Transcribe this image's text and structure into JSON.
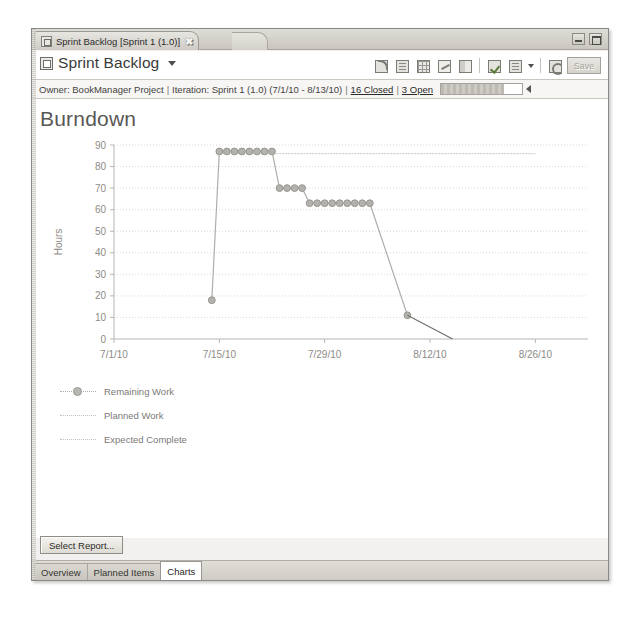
{
  "window": {
    "editor_tab_label": "Sprint Backlog [Sprint 1 (1.0)]",
    "close_glyph": "✖",
    "minimize_name": "minimize-button",
    "maximize_name": "maximize-button"
  },
  "form_header": {
    "title": "Sprint Backlog",
    "dropdown_caret": "▾",
    "save_label": "Save",
    "toolbar_icons": [
      "rss-feed-icon",
      "document-icon",
      "table-grid-icon",
      "link-icon",
      "collapse-panel-icon",
      "edit-checklist-icon",
      "new-document-icon",
      "refresh-icon"
    ]
  },
  "info_strip": {
    "owner_label": "Owner:",
    "owner_value": "BookManager Project",
    "iteration_label": "Iteration:",
    "iteration_value": "Sprint 1 (1.0) (7/1/10 - 8/13/10)",
    "closed_link": "16 Closed",
    "open_link": "3 Open",
    "separator": "|",
    "progress_percent": 78
  },
  "chart_data": {
    "type": "line",
    "title": "Burndown",
    "xlabel": "",
    "ylabel": "Hours",
    "ylim": [
      0,
      90
    ],
    "ytick_step": 10,
    "yticks": [
      0,
      10,
      20,
      30,
      40,
      50,
      60,
      70,
      80,
      90
    ],
    "xticks": [
      "7/1/10",
      "7/15/10",
      "7/29/10",
      "8/12/10",
      "8/26/10"
    ],
    "x_range_days": [
      0,
      63
    ],
    "xtick_days": [
      0,
      14,
      28,
      42,
      56
    ],
    "grid": true,
    "legend_position": "below-left",
    "colors": {
      "remaining_work": "#b0aeaa",
      "planned_work": "#c8c6c2",
      "expected_complete": "#6f6e6b",
      "grid": "#dcdad6",
      "axis": "#b8b6b2",
      "marker_fill": "#b4b2ae",
      "marker_stroke": "#98968f"
    },
    "series": [
      {
        "name": "Remaining Work",
        "marker": true,
        "points": [
          {
            "day": 13,
            "hours": 18
          },
          {
            "day": 14,
            "hours": 87
          },
          {
            "day": 15,
            "hours": 87
          },
          {
            "day": 16,
            "hours": 87
          },
          {
            "day": 17,
            "hours": 87
          },
          {
            "day": 18,
            "hours": 87
          },
          {
            "day": 19,
            "hours": 87
          },
          {
            "day": 20,
            "hours": 87
          },
          {
            "day": 21,
            "hours": 87
          },
          {
            "day": 22,
            "hours": 70
          },
          {
            "day": 23,
            "hours": 70
          },
          {
            "day": 24,
            "hours": 70
          },
          {
            "day": 25,
            "hours": 70
          },
          {
            "day": 26,
            "hours": 63
          },
          {
            "day": 27,
            "hours": 63
          },
          {
            "day": 28,
            "hours": 63
          },
          {
            "day": 29,
            "hours": 63
          },
          {
            "day": 30,
            "hours": 63
          },
          {
            "day": 31,
            "hours": 63
          },
          {
            "day": 32,
            "hours": 63
          },
          {
            "day": 33,
            "hours": 63
          },
          {
            "day": 34,
            "hours": 63
          },
          {
            "day": 39,
            "hours": 11
          }
        ]
      },
      {
        "name": "Planned Work",
        "marker": false,
        "points": [
          {
            "day": 14,
            "hours": 86
          },
          {
            "day": 56,
            "hours": 86
          }
        ]
      },
      {
        "name": "Expected Complete",
        "marker": false,
        "points": [
          {
            "day": 39,
            "hours": 11
          },
          {
            "day": 45,
            "hours": 0
          }
        ]
      }
    ],
    "legend": [
      {
        "label": "Remaining Work",
        "style": "dotted-marker",
        "color": "#b0aeaa"
      },
      {
        "label": "Planned Work",
        "style": "dotted",
        "color": "#c8c6c2"
      },
      {
        "label": "Expected Complete",
        "style": "dotted",
        "color": "#c8c6c2"
      }
    ]
  },
  "footer": {
    "select_report_label": "Select Report...",
    "tabs": [
      {
        "label": "Overview",
        "active": false
      },
      {
        "label": "Planned Items",
        "active": false
      },
      {
        "label": "Charts",
        "active": true
      }
    ]
  }
}
